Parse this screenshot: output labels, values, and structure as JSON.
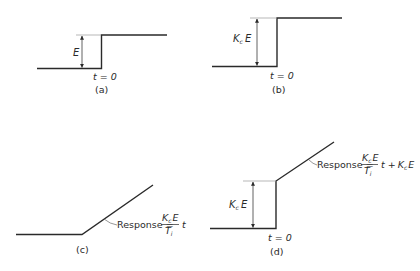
{
  "figure": {
    "panels": [
      {
        "id": "a",
        "caption": "(a)",
        "time_label": "t = 0",
        "magnitude_label": "E",
        "description": "Step change in error of magnitude E at t = 0"
      },
      {
        "id": "b",
        "caption": "(b)",
        "time_label": "t = 0",
        "magnitude_label_main": "K",
        "magnitude_label_sub": "c",
        "magnitude_label_tail": "E",
        "description": "Proportional controller response, step of magnitude KcE"
      },
      {
        "id": "c",
        "caption": "(c)",
        "response_prefix": "Response =",
        "numerator_main": "K",
        "numerator_sub": "c",
        "numerator_tail": "E",
        "denominator_main": "T",
        "denominator_sub": "i",
        "response_suffix": "t",
        "description": "Integral controller response, ramp of slope KcE/Ti"
      },
      {
        "id": "d",
        "caption": "(d)",
        "time_label": "t = 0",
        "magnitude_label_main": "K",
        "magnitude_label_sub": "c",
        "magnitude_label_tail": "E",
        "response_prefix": "Response =",
        "numerator_main": "K",
        "numerator_sub": "c",
        "numerator_tail": "E",
        "denominator_main": "T",
        "denominator_sub": "i",
        "response_suffix": "t +",
        "response_tail_main": "K",
        "response_tail_sub": "c",
        "response_tail_tail": "E",
        "description": "PI controller response, step KcE plus ramp"
      }
    ],
    "colors": {
      "line": "#2a2a2a",
      "dimension": "#3a3a3a",
      "extension": "#9a9a9a"
    }
  }
}
